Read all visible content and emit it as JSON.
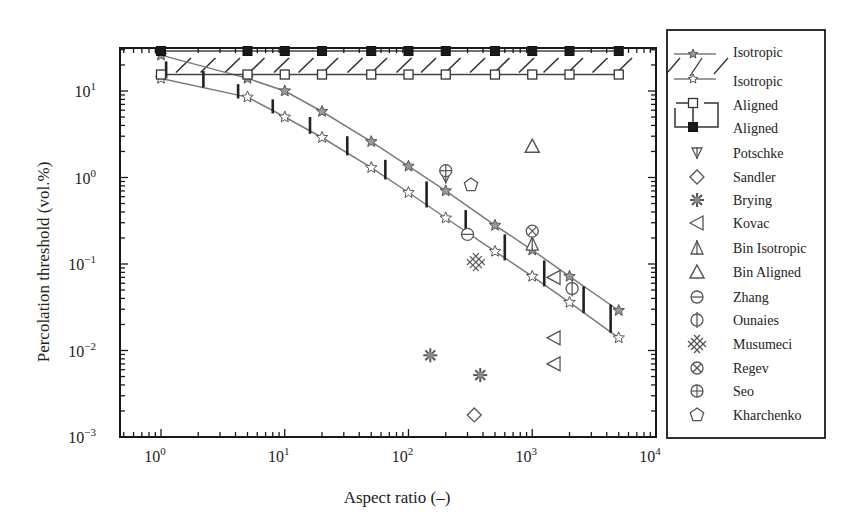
{
  "chart_data": {
    "type": "scatter",
    "title": "",
    "xlabel": "Aspect ratio (–)",
    "ylabel": "Percolation threshold (vol.%)",
    "xscale": "log",
    "yscale": "log",
    "xlim": [
      0.5,
      10000
    ],
    "ylim": [
      0.001,
      40
    ],
    "xticks": [
      {
        "v": 1,
        "base": "10",
        "exp": "0"
      },
      {
        "v": 10,
        "base": "10",
        "exp": "1"
      },
      {
        "v": 100,
        "base": "10",
        "exp": "2"
      },
      {
        "v": 1000,
        "base": "10",
        "exp": "3"
      },
      {
        "v": 10000,
        "base": "10",
        "exp": "4"
      }
    ],
    "yticks": [
      {
        "v": 10,
        "base": "10",
        "exp": "1"
      },
      {
        "v": 1,
        "base": "10",
        "exp": "0"
      },
      {
        "v": 0.1,
        "base": "10",
        "exp": "−1"
      },
      {
        "v": 0.01,
        "base": "10",
        "exp": "−2"
      },
      {
        "v": 0.001,
        "base": "10",
        "exp": "−3"
      }
    ],
    "grid": false,
    "legend_position": "right-outside",
    "bands": [
      {
        "name": "Isotropic",
        "style": "gray line, star markers, hatched vertical bars",
        "upper": {
          "x": [
            1,
            5,
            10,
            20,
            50,
            100,
            200,
            500,
            1000,
            2000,
            5000
          ],
          "y": [
            26,
            8.5,
            5,
            2.8,
            1.3,
            0.67,
            0.34,
            0.14,
            0.072,
            0.036,
            0.015
          ]
        },
        "lower": {
          "x": [
            1,
            5,
            10,
            20,
            50,
            100,
            200,
            500,
            1000,
            2000,
            5000
          ],
          "y": [
            14,
            8.5,
            5,
            2.8,
            1.3,
            0.67,
            0.34,
            0.14,
            0.072,
            0.036,
            0.015
          ]
        }
      }
    ],
    "series": [
      {
        "name": "Isotropic (upper)",
        "marker": "star-gray",
        "line": true,
        "x": [
          1,
          5,
          10,
          20,
          50,
          100,
          200,
          500,
          1000,
          2000,
          5000
        ],
        "y": [
          26,
          14,
          10,
          5.8,
          2.6,
          1.35,
          0.7,
          0.28,
          0.145,
          0.072,
          0.029
        ]
      },
      {
        "name": "Isotropic (lower)",
        "marker": "star-open",
        "line": true,
        "x": [
          1,
          5,
          10,
          20,
          50,
          100,
          200,
          500,
          1000,
          2000,
          5000
        ],
        "y": [
          14,
          8.5,
          5,
          2.9,
          1.3,
          0.67,
          0.34,
          0.14,
          0.072,
          0.036,
          0.014
        ]
      },
      {
        "name": "Aligned (lower)",
        "marker": "square-open",
        "line": true,
        "x": [
          1,
          5,
          10,
          20,
          50,
          100,
          200,
          500,
          1000,
          2000,
          5000
        ],
        "y": [
          15.5,
          15.5,
          15.5,
          15.5,
          15.5,
          15.5,
          15.5,
          15.5,
          15.5,
          15.5,
          15.5
        ]
      },
      {
        "name": "Aligned (upper)",
        "marker": "square-filled",
        "line": true,
        "x": [
          1,
          5,
          10,
          20,
          50,
          100,
          200,
          500,
          1000,
          2000,
          5000
        ],
        "y": [
          29,
          29,
          29,
          29,
          29,
          29,
          29,
          29,
          29,
          29,
          29
        ]
      },
      {
        "name": "Potschke",
        "marker": "potschke",
        "x": [
          200
        ],
        "y": [
          1.0
        ]
      },
      {
        "name": "Sandler",
        "marker": "diamond-open",
        "x": [
          340
        ],
        "y": [
          0.0018
        ]
      },
      {
        "name": "Brying",
        "marker": "asterisk",
        "x": [
          150,
          380
        ],
        "y": [
          0.0088,
          0.0052
        ]
      },
      {
        "name": "Kovac",
        "marker": "triangle-left",
        "x": [
          1500,
          1500,
          1500
        ],
        "y": [
          0.07,
          0.014,
          0.007
        ]
      },
      {
        "name": "Bin Isotropic",
        "marker": "triangle-up-bar",
        "x": [
          1000
        ],
        "y": [
          0.17
        ]
      },
      {
        "name": "Bin Aligned",
        "marker": "triangle-up-open",
        "x": [
          1000
        ],
        "y": [
          2.3
        ]
      },
      {
        "name": "Zhang",
        "marker": "circle-hbar",
        "x": [
          300
        ],
        "y": [
          0.22
        ]
      },
      {
        "name": "Ounaies",
        "marker": "circle-vbar",
        "x": [
          2100
        ],
        "y": [
          0.052
        ]
      },
      {
        "name": "Musumeci",
        "marker": "crosshatch",
        "x": [
          350
        ],
        "y": [
          0.105
        ]
      },
      {
        "name": "Regev",
        "marker": "circle-x",
        "x": [
          1000
        ],
        "y": [
          0.24
        ]
      },
      {
        "name": "Seo",
        "marker": "circle-plus",
        "x": [
          200
        ],
        "y": [
          1.2
        ]
      },
      {
        "name": "Kharchenko",
        "marker": "pentagon-open",
        "x": [
          320
        ],
        "y": [
          0.82
        ]
      }
    ],
    "vertical_bars_isotropic": [
      {
        "x": 1.1,
        "y1": 14,
        "y2": 22
      },
      {
        "x": 2.2,
        "y1": 11,
        "y2": 17
      },
      {
        "x": 4.2,
        "y1": 8.2,
        "y2": 12
      },
      {
        "x": 8,
        "y1": 5.5,
        "y2": 8
      },
      {
        "x": 16,
        "y1": 3.2,
        "y2": 5
      },
      {
        "x": 32,
        "y1": 1.8,
        "y2": 3
      },
      {
        "x": 65,
        "y1": 0.95,
        "y2": 1.6
      },
      {
        "x": 140,
        "y1": 0.45,
        "y2": 0.9
      },
      {
        "x": 290,
        "y1": 0.22,
        "y2": 0.42
      },
      {
        "x": 600,
        "y1": 0.11,
        "y2": 0.22
      },
      {
        "x": 1250,
        "y1": 0.055,
        "y2": 0.11
      },
      {
        "x": 2600,
        "y1": 0.027,
        "y2": 0.055
      },
      {
        "x": 4300,
        "y1": 0.016,
        "y2": 0.034
      }
    ]
  },
  "legend": {
    "items": [
      {
        "label": "Isotropic",
        "symbol": "star-gray-line-hatch-top"
      },
      {
        "label": "Isotropic",
        "symbol": "star-open-line-hatch-bottom"
      },
      {
        "label": "Aligned",
        "symbol": "square-open-bracket-top"
      },
      {
        "label": "Aligned",
        "symbol": "square-filled-bracket-bottom"
      },
      {
        "label": "Potschke",
        "symbol": "potschke"
      },
      {
        "label": "Sandler",
        "symbol": "diamond-open"
      },
      {
        "label": "Brying",
        "symbol": "asterisk"
      },
      {
        "label": "Kovac",
        "symbol": "triangle-left"
      },
      {
        "label": "Bin Isotropic",
        "symbol": "triangle-up-bar"
      },
      {
        "label": "Bin Aligned",
        "symbol": "triangle-up-open"
      },
      {
        "label": "Zhang",
        "symbol": "circle-hbar"
      },
      {
        "label": "Ounaies",
        "symbol": "circle-vbar"
      },
      {
        "label": "Musumeci",
        "symbol": "crosshatch"
      },
      {
        "label": "Regev",
        "symbol": "circle-x"
      },
      {
        "label": "Seo",
        "symbol": "circle-plus"
      },
      {
        "label": "Kharchenko",
        "symbol": "pentagon-open"
      }
    ]
  },
  "colors": {
    "axis": "#1a1a1a",
    "gray_line": "#7a7a7a",
    "marker": "#555555",
    "bar": "#222222",
    "filled_square": "#1a1a1a"
  }
}
